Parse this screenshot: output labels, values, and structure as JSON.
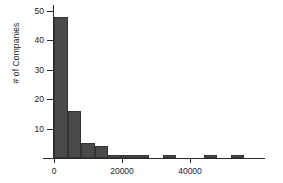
{
  "chart_data": {
    "type": "bar",
    "title": "",
    "subtitle": "",
    "xlabel": "",
    "ylabel": "# of Companies",
    "xlim": [
      -2000,
      60000
    ],
    "ylim": [
      0,
      52
    ],
    "grid": false,
    "legend": null,
    "bin_width": 4000,
    "bar_color": "#4a4a4a",
    "bar_edge_color": "#333333",
    "axis_color": "#2b2b2b",
    "background": "#ffffff",
    "x_ticks": [
      {
        "value": 0,
        "label": "0"
      },
      {
        "value": 20000,
        "label": "20000"
      },
      {
        "value": 40000,
        "label": "40000"
      }
    ],
    "y_ticks": [
      {
        "value": 10,
        "label": "10"
      },
      {
        "value": 20,
        "label": "20"
      },
      {
        "value": 30,
        "label": "30"
      },
      {
        "value": 40,
        "label": "40"
      },
      {
        "value": 50,
        "label": "50"
      }
    ],
    "bins": [
      {
        "x0": 0,
        "x1": 4000,
        "count": 48
      },
      {
        "x0": 4000,
        "x1": 8000,
        "count": 16
      },
      {
        "x0": 8000,
        "x1": 12000,
        "count": 5
      },
      {
        "x0": 12000,
        "x1": 16000,
        "count": 4
      },
      {
        "x0": 16000,
        "x1": 20000,
        "count": 1
      },
      {
        "x0": 20000,
        "x1": 24000,
        "count": 1
      },
      {
        "x0": 24000,
        "x1": 28000,
        "count": 1
      },
      {
        "x0": 28000,
        "x1": 32000,
        "count": 0
      },
      {
        "x0": 32000,
        "x1": 36000,
        "count": 1
      },
      {
        "x0": 36000,
        "x1": 40000,
        "count": 0
      },
      {
        "x0": 40000,
        "x1": 44000,
        "count": 0
      },
      {
        "x0": 44000,
        "x1": 48000,
        "count": 1
      },
      {
        "x0": 48000,
        "x1": 52000,
        "count": 0
      },
      {
        "x0": 52000,
        "x1": 56000,
        "count": 1
      }
    ],
    "categories": [
      "0-4000",
      "4000-8000",
      "8000-12000",
      "12000-16000",
      "16000-20000",
      "20000-24000",
      "24000-28000",
      "28000-32000",
      "32000-36000",
      "36000-40000",
      "40000-44000",
      "44000-48000",
      "48000-52000",
      "52000-56000"
    ],
    "values": [
      48,
      16,
      5,
      4,
      1,
      1,
      1,
      0,
      1,
      0,
      0,
      1,
      0,
      1
    ]
  }
}
